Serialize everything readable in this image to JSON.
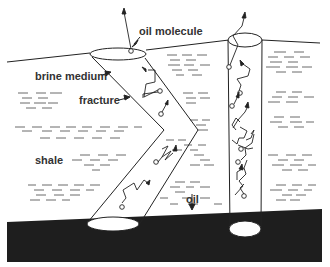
{
  "figure": {
    "labels": {
      "oil_molecule": "oil molecule",
      "brine_medium": "brine medium",
      "fracture": "fracture",
      "shale": "shale",
      "oil": "oil"
    },
    "regions": [
      "surface",
      "shale layer",
      "oil reservoir"
    ],
    "structures": [
      "inclined V-shaped fracture tube",
      "vertical well tube"
    ],
    "colors": {
      "ink": "#222222",
      "oil_layer": "#1e1e1e",
      "background": "#ffffff"
    }
  }
}
